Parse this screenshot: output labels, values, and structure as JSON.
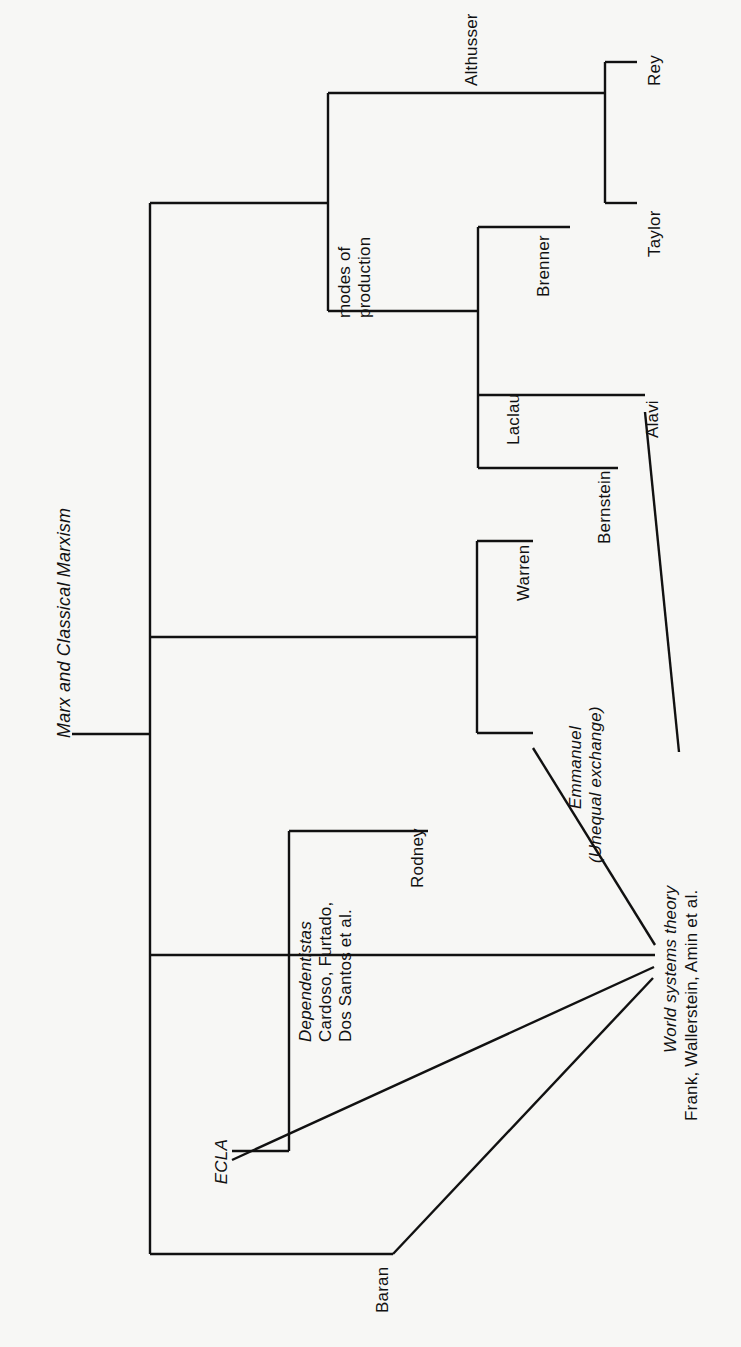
{
  "figure": {
    "type": "tree-diagram",
    "orientation": "rotated-90-clockwise",
    "background_color": "#f7f7f5",
    "line_color": "#111111",
    "root": {
      "label": "Marx and Classical Marxism",
      "style": "italic"
    },
    "nodes": {
      "modes_of_production": "modes of\nproduction",
      "modes_of_production_line1": "modes of",
      "modes_of_production_line2": "production",
      "althusser": "Althusser",
      "rey": "Rey",
      "taylor": "Taylor",
      "brenner": "Brenner",
      "laclau": "Laclau",
      "bernstein": "Bernstein",
      "alavi": "Alavi",
      "warren": "Warren",
      "emmanuel_line1": "Emmanuel",
      "emmanuel_line2": "(Unequal exchange)",
      "rodney": "Rodney",
      "dependentistas_line1": "Dependentistas",
      "dependentistas_line2": "Cardoso, Furtado,",
      "dependentistas_line3": "Dos Santos et al.",
      "ecla": "ECLA",
      "baran": "Baran",
      "world_systems_line1": "World systems theory",
      "world_systems_line2": "Frank, Wallerstein, Amin et al."
    },
    "branch_groups": [
      {
        "name": "modes-of-production",
        "children": [
          "Althusser",
          "Brenner",
          "Laclau",
          "Bernstein"
        ]
      },
      {
        "name": "althusser",
        "children": [
          "Rey",
          "Taylor"
        ]
      },
      {
        "name": "warren-emmanuel",
        "children": [
          "Warren",
          "Emmanuel (Unequal exchange)"
        ]
      },
      {
        "name": "dependentistas",
        "children": [
          "Rodney",
          "ECLA"
        ]
      },
      {
        "name": "world-systems-inputs",
        "children": [
          "Alavi",
          "Emmanuel (Unequal exchange)",
          "ECLA",
          "Baran",
          "Dependentistas"
        ]
      }
    ]
  }
}
